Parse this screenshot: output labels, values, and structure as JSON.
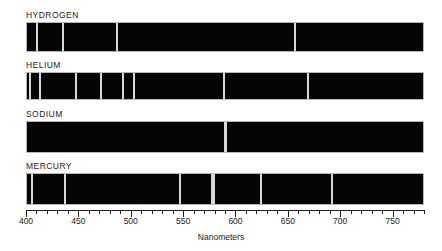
{
  "figure": {
    "axis_title": "Nanometers",
    "axis": {
      "min": 400,
      "max": 780,
      "major_step": 50,
      "minor_step": 10,
      "tick_labels": [
        400,
        450,
        500,
        550,
        600,
        650,
        700,
        750
      ],
      "unit": "nm"
    },
    "colors": {
      "background": "#ffffff",
      "band_fill": "#050505",
      "band_border": "#b9b9b9",
      "emission_line": "#d8d8d8",
      "text": "#1a1a1a",
      "axis": "#202020"
    }
  },
  "chart_data": {
    "type": "line",
    "xlabel": "Nanometers",
    "ylabel": "",
    "xlim": [
      400,
      780
    ],
    "grid": false,
    "legend": "none",
    "series": [
      {
        "name": "HYDROGEN",
        "label": "HYDROGEN",
        "values": [
          410,
          434,
          486,
          656
        ]
      },
      {
        "name": "HELIUM",
        "label": "HELIUM",
        "values": [
          403,
          412,
          447,
          471,
          492,
          502,
          588,
          668
        ]
      },
      {
        "name": "SODIUM",
        "label": "SODIUM",
        "values": [
          589,
          590
        ]
      },
      {
        "name": "MERCURY",
        "label": "MERCURY",
        "values": [
          405,
          436,
          546,
          577,
          579,
          623,
          691
        ]
      }
    ]
  },
  "rows": [
    {
      "label": "HYDROGEN",
      "label_top": 10,
      "band_top": 22,
      "band_height": 30,
      "lines": [
        {
          "wavelength": 410,
          "width": 2
        },
        {
          "wavelength": 434,
          "width": 2
        },
        {
          "wavelength": 486,
          "width": 2
        },
        {
          "wavelength": 656,
          "width": 2
        }
      ]
    },
    {
      "label": "HELIUM",
      "label_top": 60,
      "band_top": 72,
      "band_height": 28,
      "lines": [
        {
          "wavelength": 403,
          "width": 2
        },
        {
          "wavelength": 412,
          "width": 2
        },
        {
          "wavelength": 447,
          "width": 2
        },
        {
          "wavelength": 471,
          "width": 2
        },
        {
          "wavelength": 492,
          "width": 2
        },
        {
          "wavelength": 502,
          "width": 2
        },
        {
          "wavelength": 588,
          "width": 2
        },
        {
          "wavelength": 668,
          "width": 2
        }
      ]
    },
    {
      "label": "SODIUM",
      "label_top": 109,
      "band_top": 121,
      "band_height": 32,
      "lines": [
        {
          "wavelength": 589,
          "width": 2
        },
        {
          "wavelength": 590,
          "width": 2
        }
      ]
    },
    {
      "label": "MERCURY",
      "label_top": 161,
      "band_top": 173,
      "band_height": 32,
      "lines": [
        {
          "wavelength": 405,
          "width": 2
        },
        {
          "wavelength": 436,
          "width": 2
        },
        {
          "wavelength": 546,
          "width": 2
        },
        {
          "wavelength": 577,
          "width": 2
        },
        {
          "wavelength": 579,
          "width": 2
        },
        {
          "wavelength": 623,
          "width": 2
        },
        {
          "wavelength": 691,
          "width": 2
        }
      ]
    }
  ]
}
